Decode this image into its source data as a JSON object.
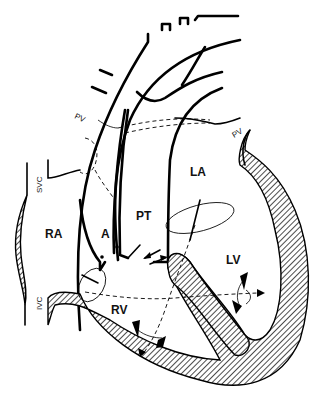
{
  "figure": {
    "type": "anatomical line diagram",
    "labels": {
      "ra": "RA",
      "la": "LA",
      "rv": "RV",
      "lv": "LV",
      "aorta": "A",
      "pt": "PT",
      "svc": "SVC",
      "ivc": "IVC",
      "pv_left": "PV",
      "pv_right": "PV"
    },
    "colors": {
      "ink": "#000000",
      "background": "#ffffff"
    }
  }
}
